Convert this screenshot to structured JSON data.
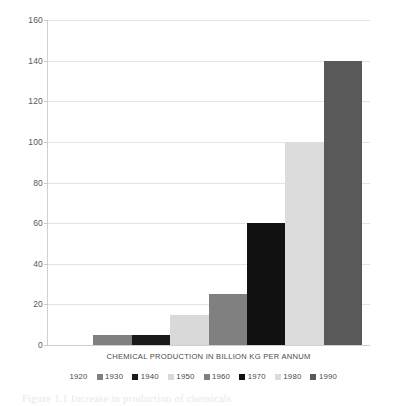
{
  "chart_data": {
    "type": "bar",
    "title": "",
    "subtitle": "",
    "xlabel": "CHEMICAL PRODUCTION IN BILLION KG PER ANNUM",
    "ylabel": "",
    "categories": [
      "CHEMICAL PRODUCTION IN BILLION KG PER ANNUM"
    ],
    "ylim": [
      0,
      160
    ],
    "ytick_labels": [
      "160",
      "140",
      "120",
      "100",
      "80",
      "60",
      "40",
      "20",
      "0"
    ],
    "ytick_values": [
      160,
      140,
      120,
      100,
      80,
      60,
      40,
      20,
      0
    ],
    "grid": true,
    "legend_position": "bottom",
    "series": [
      {
        "name": "1920",
        "values": [
          0
        ],
        "color": "#ffffff"
      },
      {
        "name": "1930",
        "values": [
          5
        ],
        "color": "#808080"
      },
      {
        "name": "1940",
        "values": [
          5
        ],
        "color": "#1a1a1a"
      },
      {
        "name": "1950",
        "values": [
          15
        ],
        "color": "#d9d9d9"
      },
      {
        "name": "1960",
        "values": [
          25
        ],
        "color": "#808080"
      },
      {
        "name": "1970",
        "values": [
          60
        ],
        "color": "#111111"
      },
      {
        "name": "1980",
        "values": [
          100
        ],
        "color": "#dcdcdc"
      },
      {
        "name": "1990",
        "values": [
          140
        ],
        "color": "#595959"
      }
    ]
  },
  "axis": {
    "title": "CHEMICAL PRODUCTION IN BILLION KG PER ANNUM"
  },
  "legend": {
    "items": [
      {
        "label": "1920",
        "color": "#ffffff"
      },
      {
        "label": "1930",
        "color": "#808080"
      },
      {
        "label": "1940",
        "color": "#1a1a1a"
      },
      {
        "label": "1950",
        "color": "#d9d9d9"
      },
      {
        "label": "1960",
        "color": "#808080"
      },
      {
        "label": "1970",
        "color": "#111111"
      },
      {
        "label": "1980",
        "color": "#dcdcdc"
      },
      {
        "label": "1990",
        "color": "#595959"
      }
    ]
  },
  "caption": {
    "text": "Figure 1.1 Increase in production of chemicals"
  }
}
